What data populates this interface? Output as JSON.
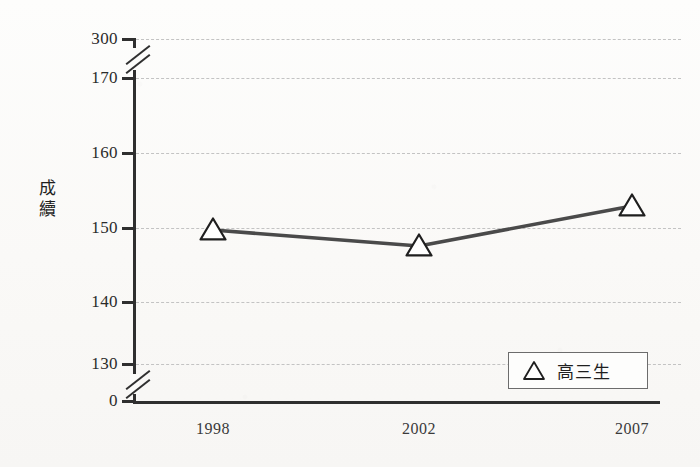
{
  "chart_data": {
    "type": "line",
    "title": "",
    "xlabel": "",
    "ylabel": "成績",
    "categories": [
      "1998",
      "2002",
      "2007"
    ],
    "series": [
      {
        "name": "高三生",
        "marker": "triangle-up",
        "color": "#4a4a4a",
        "values": [
          150,
          147.6,
          152.9
        ]
      }
    ],
    "y_ticks": [
      "0",
      "130",
      "140",
      "150",
      "160",
      "170",
      "300"
    ],
    "y_tick_values": [
      0,
      130,
      140,
      150,
      160,
      170,
      300
    ],
    "ylim": [
      0,
      300
    ],
    "axis_break": true,
    "axis_break_note": "y-axis broken between 0 and 130, and between 170 and 300",
    "grid": "horizontal-dashed",
    "legend_position": "bottom-right"
  },
  "axis": {
    "y_title_chars": [
      "成",
      "續"
    ],
    "ticks": [
      {
        "label": "300",
        "y": 39
      },
      {
        "label": "170",
        "y": 78
      },
      {
        "label": "160",
        "y": 153
      },
      {
        "label": "150",
        "y": 228
      },
      {
        "label": "140",
        "y": 302
      },
      {
        "label": "130",
        "y": 364
      },
      {
        "label": "0",
        "y": 402
      }
    ]
  },
  "x_axis": {
    "labels": [
      {
        "text": "1998",
        "x": 213
      },
      {
        "text": "2002",
        "x": 419
      },
      {
        "text": "2007",
        "x": 632
      }
    ]
  },
  "points": [
    {
      "category": "1998",
      "value": 150,
      "x": 213,
      "y": 230
    },
    {
      "category": "2002",
      "value": 147.6,
      "x": 419,
      "y": 246
    },
    {
      "category": "2007",
      "value": 152.9,
      "x": 632,
      "y": 206
    }
  ],
  "legend": {
    "marker": "triangle-up",
    "label": "高三生"
  },
  "colors": {
    "series_line": "#4a4a4a",
    "axis": "#2f2f2f",
    "gridline": "#c3c3c3",
    "background": "#fbfbf9",
    "text": "#2b2b2b"
  }
}
